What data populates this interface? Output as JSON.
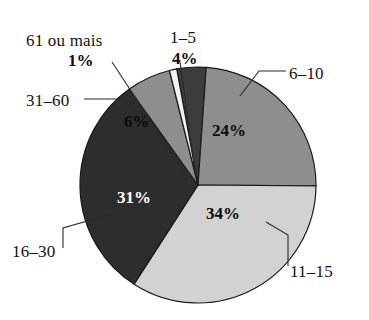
{
  "chart_data": {
    "type": "pie",
    "title": "",
    "subtitle": "",
    "xlabel": "",
    "ylabel": "",
    "legend_position": "callout-labels",
    "grid": false,
    "value_suffix": "%",
    "categories": [
      "1–5",
      "6–10",
      "11–15",
      "16–30",
      "31–60",
      "61 ou mais"
    ],
    "values": [
      4,
      24,
      34,
      31,
      6,
      1
    ],
    "labels": [
      "4%",
      "24%",
      "34%",
      "31%",
      "6%",
      "1%"
    ],
    "colors": [
      "#3c3c3c",
      "#8e8e8e",
      "#d2d2d2",
      "#2d2d2d",
      "#8e8e8e",
      "#f2f2f2"
    ],
    "slices": [
      {
        "category": "1–5",
        "value": 4,
        "label": "4%",
        "color": "#3c3c3c",
        "text_color": "#111111",
        "start_angle": -10.4,
        "end_angle": 4.0
      },
      {
        "category": "6–10",
        "value": 24,
        "label": "24%",
        "color": "#8e8e8e",
        "text_color": "#111111",
        "start_angle": 4.0,
        "end_angle": 90.4
      },
      {
        "category": "11–15",
        "value": 34,
        "label": "34%",
        "color": "#d2d2d2",
        "text_color": "#0b0b0b",
        "start_angle": 90.4,
        "end_angle": 212.8
      },
      {
        "category": "16–30",
        "value": 31,
        "label": "31%",
        "color": "#2d2d2d",
        "text_color": "#ffffff",
        "start_angle": 212.8,
        "end_angle": 324.4
      },
      {
        "category": "31–60",
        "value": 6,
        "label": "6%",
        "color": "#8e8e8e",
        "text_color": "#111111",
        "start_angle": 324.4,
        "end_angle": 346.0
      },
      {
        "category": "61 ou mais",
        "value": 1,
        "label": "1%",
        "color": "#f2f2f2",
        "text_color": "#111111",
        "start_angle": 346.0,
        "end_angle": 349.6
      }
    ]
  },
  "callouts": {
    "label_61_ou_mais": "61 ou mais",
    "pct_61_ou_mais": "1%",
    "label_1_5": "1–5",
    "pct_1_5": "4%",
    "label_31_60": "31–60",
    "label_6_10": "6–10",
    "label_11_15": "11–15",
    "label_16_30": "16–30"
  },
  "slice_values": {
    "pct_6_10": "24%",
    "pct_11_15": "34%",
    "pct_16_30": "31%",
    "pct_31_60": "6%"
  }
}
